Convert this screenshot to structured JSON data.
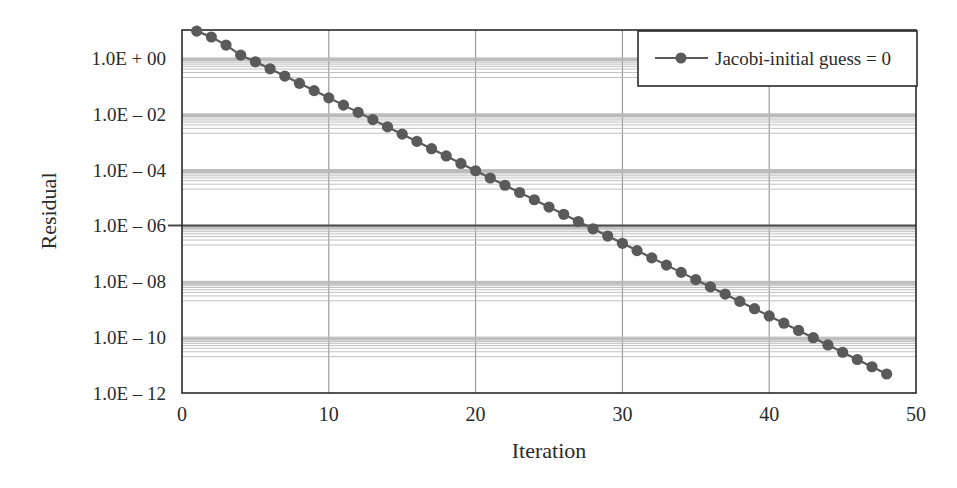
{
  "chart_data": {
    "type": "line",
    "title": "",
    "xlabel": "Iteration",
    "ylabel": "Residual",
    "x_scale": "linear",
    "y_scale": "log",
    "xlim": [
      0,
      50
    ],
    "ylim": [
      1e-12,
      10
    ],
    "x_ticks": [
      0,
      10,
      20,
      30,
      40,
      50
    ],
    "x_tick_labels": [
      "0",
      "10",
      "20",
      "30",
      "40",
      "50"
    ],
    "y_ticks": [
      1,
      0.01,
      0.0001,
      1e-06,
      1e-08,
      1e-10,
      1e-12
    ],
    "y_tick_labels": [
      "1.0E + 00",
      "1.0E – 02",
      "1.0E – 04",
      "1.0E – 06",
      "1.0E – 08",
      "1.0E – 10",
      "1.0E – 12"
    ],
    "grid": true,
    "reference_line": {
      "y": 1e-06,
      "label": "1.0E – 06"
    },
    "legend": {
      "position": "upper right",
      "entries": [
        "Jacobi-initial guess = 0"
      ]
    },
    "series": [
      {
        "name": "Jacobi-initial guess = 0",
        "marker": "circle",
        "color": "#5a5a5a",
        "x": [
          1,
          2,
          3,
          4,
          5,
          6,
          7,
          8,
          9,
          10,
          11,
          12,
          13,
          14,
          15,
          16,
          17,
          18,
          19,
          20,
          21,
          22,
          23,
          24,
          25,
          26,
          27,
          28,
          29,
          30,
          31,
          32,
          33,
          34,
          35,
          36,
          37,
          38,
          39,
          40,
          41,
          42,
          43,
          44,
          45,
          46,
          47,
          48
        ],
        "log10_values": [
          0.96,
          0.75,
          0.46,
          0.1,
          -0.14,
          -0.39,
          -0.65,
          -0.91,
          -1.17,
          -1.43,
          -1.69,
          -1.95,
          -2.21,
          -2.47,
          -2.73,
          -2.99,
          -3.25,
          -3.51,
          -3.78,
          -4.04,
          -4.3,
          -4.56,
          -4.82,
          -5.08,
          -5.34,
          -5.6,
          -5.86,
          -6.12,
          -6.38,
          -6.64,
          -6.9,
          -7.16,
          -7.42,
          -7.68,
          -7.94,
          -8.2,
          -8.46,
          -8.72,
          -8.98,
          -9.24,
          -9.5,
          -9.76,
          -10.02,
          -10.28,
          -10.54,
          -10.8,
          -11.06,
          -11.32
        ],
        "values": [
          9.1,
          5.6,
          2.9,
          1.26,
          0.72,
          0.41,
          0.22,
          0.12,
          0.068,
          0.037,
          0.02,
          0.011,
          0.0062,
          0.0034,
          0.0019,
          0.001,
          0.00056,
          0.00031,
          0.00017,
          9.1e-05,
          5e-05,
          2.8e-05,
          1.5e-05,
          8.3e-06,
          4.6e-06,
          2.5e-06,
          1.4e-06,
          7.6e-07,
          4.2e-07,
          2.3e-07,
          1.3e-07,
          6.9e-08,
          3.8e-08,
          2.1e-08,
          1.1e-08,
          6.3e-09,
          3.5e-09,
          1.9e-09,
          1e-09,
          5.8e-10,
          3.2e-10,
          1.7e-10,
          9.5e-11,
          5.2e-11,
          2.9e-11,
          1.6e-11,
          8.7e-12,
          4.8e-12
        ]
      }
    ]
  },
  "colors": {
    "axis": "#2a2a2a",
    "major_grid": "#8a8a8a",
    "minor_grid": "#b9b9b9",
    "series": "#5a5a5a",
    "reference_line": "#4a4a4a"
  }
}
